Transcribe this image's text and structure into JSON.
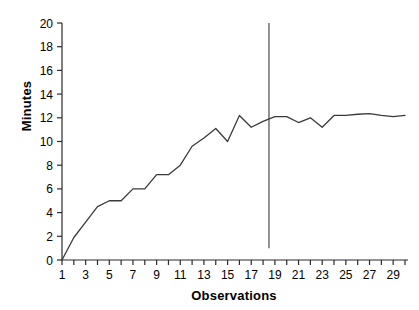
{
  "chart_data": {
    "type": "line",
    "title": "",
    "xlabel": "Observations",
    "ylabel": "Minutes",
    "xlim": [
      1,
      30
    ],
    "ylim": [
      0,
      20
    ],
    "ytick_step": 2,
    "xtick_step": 1,
    "grid": false,
    "legend": null,
    "line_color": "#3a3a3a",
    "x": [
      1,
      2,
      3,
      4,
      5,
      6,
      7,
      8,
      9,
      10,
      11,
      12,
      13,
      14,
      15,
      16,
      17,
      18,
      19,
      20,
      21,
      22,
      23,
      24,
      25,
      26,
      27,
      28,
      29,
      30
    ],
    "values": [
      0.0,
      1.9,
      3.2,
      4.5,
      5.0,
      5.0,
      6.0,
      6.0,
      7.2,
      7.2,
      8.0,
      9.6,
      10.3,
      11.1,
      10.0,
      12.2,
      11.2,
      11.7,
      12.1,
      12.1,
      11.6,
      12.0,
      11.2,
      12.2,
      12.2,
      12.3,
      12.35,
      12.2,
      12.1,
      12.2
    ],
    "ytick_labels": [
      "0",
      "2",
      "4",
      "6",
      "8",
      "10",
      "12",
      "14",
      "16",
      "18",
      "20"
    ],
    "ytick_values": [
      0,
      2,
      4,
      6,
      8,
      10,
      12,
      14,
      16,
      18,
      20
    ],
    "xtick_labels": [
      "1",
      "",
      "3",
      "",
      "5",
      "",
      "7",
      "",
      "9",
      "",
      "11",
      "",
      "13",
      "",
      "15",
      "",
      "17",
      "",
      "19",
      "",
      "21",
      "",
      "23",
      "",
      "25",
      "",
      "27",
      "",
      "29",
      ""
    ],
    "annotations": [
      {
        "name": "vertical-reference-line",
        "type": "vline",
        "x": 18.5,
        "y_from": 1.0,
        "y_to": 20.0,
        "color": "#3a3a3a"
      }
    ]
  },
  "axes": {
    "y_axis_title": "Minutes",
    "x_axis_title": "Observations"
  }
}
